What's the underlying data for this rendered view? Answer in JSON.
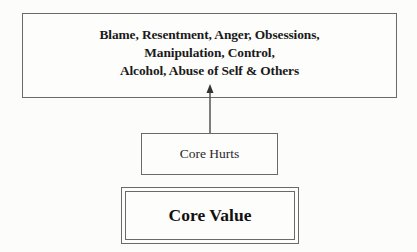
{
  "diagram": {
    "top_box": {
      "lines": [
        "Blame, Resentment, Anger, Obsessions,",
        "Manipulation, Control,",
        "Alcohol, Abuse of Self & Others"
      ]
    },
    "middle_box": {
      "label": "Core Hurts"
    },
    "bottom_box": {
      "label": "Core Value"
    },
    "connections": [
      {
        "from": "Core Hurts",
        "to": "Blame, Resentment, Anger, Obsessions, Manipulation, Control, Alcohol, Abuse of Self & Others",
        "direction": "up"
      }
    ],
    "colors": {
      "border": "#6a6a6a",
      "text": "#1a1a1a",
      "background": "#fcfcfb"
    }
  }
}
